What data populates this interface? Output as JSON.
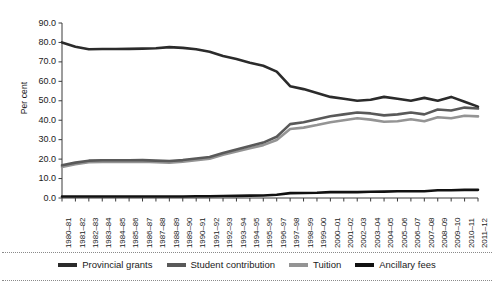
{
  "chart_data": {
    "type": "line",
    "title": "",
    "xlabel": "",
    "ylabel": "Per cent",
    "ylim": [
      0.0,
      90.0
    ],
    "yticks": [
      "0.0",
      "10.0",
      "20.0",
      "30.0",
      "40.0",
      "50.0",
      "60.0",
      "70.0",
      "80.0",
      "90.0"
    ],
    "ytick_values": [
      0,
      10,
      20,
      30,
      40,
      50,
      60,
      70,
      80,
      90
    ],
    "grid": false,
    "legend_position": "bottom",
    "categories": [
      "1980–81",
      "1981–82",
      "1982–83",
      "1983–84",
      "1984–85",
      "1985–86",
      "1986–87",
      "1987–88",
      "1988–89",
      "1989–90",
      "1990–91",
      "1991–92",
      "1992–93",
      "1993–94",
      "1994–95",
      "1995–96",
      "1996–97",
      "1997–98",
      "1998–99",
      "1999–00",
      "2000–01",
      "2001–02",
      "2002–03",
      "2003–04",
      "2004–05",
      "2005–06",
      "2006–07",
      "2007–08",
      "2008–09",
      "2009–10",
      "2010–11",
      "2011–12"
    ],
    "series": [
      {
        "name": "Provincial grants",
        "color": "#2b2b2b",
        "width": 2.6,
        "values": [
          80.0,
          77.8,
          76.5,
          76.6,
          76.6,
          76.7,
          76.8,
          77.0,
          77.6,
          77.2,
          76.5,
          75.2,
          73.0,
          71.5,
          69.6,
          68.0,
          65.0,
          57.5,
          56.0,
          54.0,
          52.0,
          51.0,
          50.0,
          50.5,
          52.0,
          51.0,
          50.0,
          51.5,
          50.0,
          52.0,
          49.5,
          47.0
        ]
      },
      {
        "name": "Student contribution",
        "color": "#595959",
        "width": 2.6,
        "values": [
          16.8,
          18.2,
          19.2,
          19.4,
          19.4,
          19.4,
          19.5,
          19.2,
          19.0,
          19.5,
          20.3,
          21.1,
          23.2,
          25.0,
          26.8,
          28.5,
          31.5,
          38.0,
          39.0,
          40.5,
          42.0,
          43.0,
          44.0,
          43.5,
          42.5,
          43.0,
          44.0,
          43.0,
          45.5,
          45.0,
          46.5,
          46.0
        ]
      },
      {
        "name": "Tuition",
        "color": "#949494",
        "width": 2.6,
        "values": [
          16.0,
          17.4,
          18.4,
          18.6,
          18.6,
          18.6,
          18.7,
          18.4,
          18.2,
          18.7,
          19.4,
          20.2,
          22.2,
          23.9,
          25.6,
          27.2,
          29.8,
          35.5,
          36.2,
          37.5,
          39.0,
          40.0,
          41.0,
          40.3,
          39.2,
          39.5,
          40.5,
          39.5,
          41.5,
          41.0,
          42.3,
          42.0
        ]
      },
      {
        "name": "Ancillary fees",
        "color": "#111111",
        "width": 2.6,
        "values": [
          0.8,
          0.8,
          0.8,
          0.8,
          0.8,
          0.8,
          0.8,
          0.8,
          0.8,
          0.8,
          0.9,
          0.9,
          1.0,
          1.1,
          1.2,
          1.3,
          1.7,
          2.5,
          2.6,
          2.7,
          3.0,
          3.0,
          3.0,
          3.2,
          3.3,
          3.5,
          3.5,
          3.5,
          4.0,
          4.0,
          4.2,
          4.2
        ]
      }
    ]
  },
  "axis": {
    "ylabel": "Per cent"
  },
  "legend": {
    "items": [
      {
        "label": "Provincial grants",
        "color": "#2b2b2b"
      },
      {
        "label": "Student contribution",
        "color": "#595959"
      },
      {
        "label": "Tuition",
        "color": "#949494"
      },
      {
        "label": "Ancillary fees",
        "color": "#111111"
      }
    ]
  }
}
